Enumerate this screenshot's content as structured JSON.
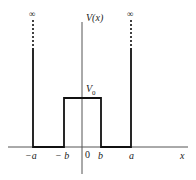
{
  "diagram": {
    "type": "potential-well",
    "y_axis_label": "V(x)",
    "x_axis_label": "x",
    "barrier_label": "V",
    "barrier_subscript": "0",
    "infinity_symbol": "∞",
    "x_ticks": [
      "−a",
      "− b",
      "0",
      "b",
      "a"
    ],
    "colors": {
      "line": "#111111",
      "axis": "#444444",
      "background": "#ffffff"
    }
  }
}
